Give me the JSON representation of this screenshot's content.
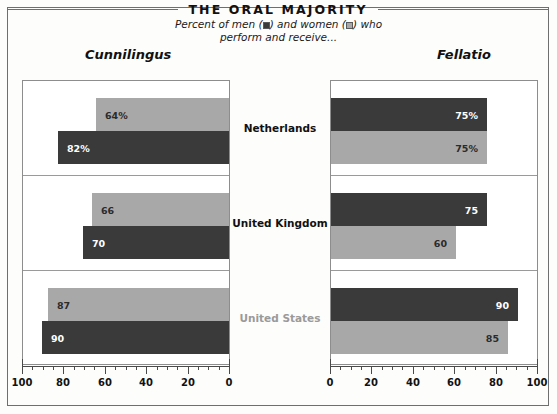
{
  "title": "THE ORAL MAJORITY",
  "subtitle": {
    "line1_before_men": "Percent of men (",
    "line1_mid": ") and women (",
    "line1_after": ") who",
    "line2": "perform and receive..."
  },
  "legend": {
    "men_label": "men",
    "women_label": "women",
    "men_color": "#3a3a3a",
    "women_color": "#a8a8a8"
  },
  "panels": {
    "left_heading": "Cunnilingus",
    "right_heading": "Fellatio"
  },
  "countries": [
    {
      "name": "Netherlands",
      "muted": false
    },
    {
      "name": "United Kingdom",
      "muted": false
    },
    {
      "name": "United States",
      "muted": true
    }
  ],
  "axis": {
    "left_ticklabels": [
      "100",
      "80",
      "60",
      "40",
      "20",
      "0"
    ],
    "right_ticklabels": [
      "0",
      "20",
      "40",
      "60",
      "80",
      "100"
    ],
    "min": 0,
    "max": 100,
    "major_step": 20,
    "minor_step": 5
  },
  "chart_data": {
    "type": "bar",
    "title": "THE ORAL MAJORITY",
    "subtitle": "Percent of men and women who perform and receive...",
    "orientation": "horizontal-bidirectional",
    "categories": [
      "Netherlands",
      "United Kingdom",
      "United States"
    ],
    "xlabel": "",
    "ylabel": "",
    "xlim": [
      0,
      100
    ],
    "grid": false,
    "legend_position": "subtitle-inline",
    "panels": [
      {
        "name": "Cunnilingus",
        "direction": "right-to-left",
        "axis_ticklabels": [
          "100",
          "80",
          "60",
          "40",
          "20",
          "0"
        ],
        "series": [
          {
            "name": "women",
            "color": "#a8a8a8",
            "row_position": "top",
            "values": [
              64,
              66,
              87
            ],
            "labels": [
              "64%",
              "66",
              "87"
            ]
          },
          {
            "name": "men",
            "color": "#3a3a3a",
            "row_position": "bottom",
            "values": [
              82,
              70,
              90
            ],
            "labels": [
              "82%",
              "70",
              "90"
            ]
          }
        ]
      },
      {
        "name": "Fellatio",
        "direction": "left-to-right",
        "axis_ticklabels": [
          "0",
          "20",
          "40",
          "60",
          "80",
          "100"
        ],
        "series": [
          {
            "name": "men",
            "color": "#3a3a3a",
            "row_position": "top",
            "values": [
              75,
              75,
              90
            ],
            "labels": [
              "75%",
              "75",
              "90"
            ]
          },
          {
            "name": "women",
            "color": "#a8a8a8",
            "row_position": "bottom",
            "values": [
              75,
              60,
              85
            ],
            "labels": [
              "75%",
              "60",
              "85"
            ]
          }
        ]
      }
    ]
  }
}
